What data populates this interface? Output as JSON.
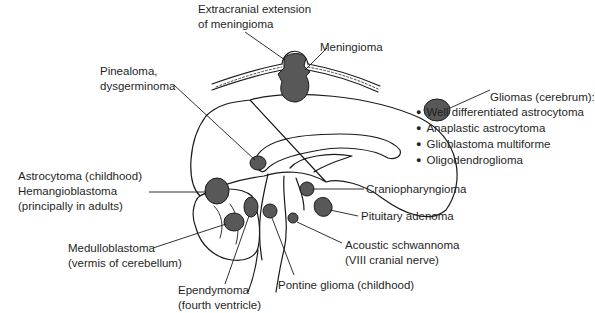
{
  "diagram": {
    "colors": {
      "tumor_fill": "#585858",
      "outline": "#1a1a1a",
      "background": "#ffffff"
    },
    "labels": {
      "extracranial": {
        "line1": "Extracranial extension",
        "line2": "of meningioma"
      },
      "meningioma": "Meningioma",
      "pinealoma": {
        "line1": "Pinealoma,",
        "line2": "dysgerminoma"
      },
      "gliomas": {
        "title": "Gliomas (cerebrum):",
        "items": [
          "Well differentiated astrocytoma",
          "Anaplastic astrocytoma",
          "Glioblastoma multiforme",
          "Oligodendroglioma"
        ]
      },
      "astrocytoma": {
        "line1": "Astrocytoma (childhood)",
        "line2": "Hemangioblastoma",
        "line3": "(principally in adults)"
      },
      "craniopharyngioma": "Craniopharyngioma",
      "pituitary": "Pituitary adenoma",
      "medulloblastoma": {
        "line1": "Medulloblastoma",
        "line2": "(vermis of cerebellum)"
      },
      "acoustic": {
        "line1": "Acoustic schwannoma",
        "line2": "(VIII cranial nerve)"
      },
      "ependymoma": {
        "line1": "Ependymoma",
        "line2": "(fourth ventricle)"
      },
      "pontine": "Pontine glioma (childhood)"
    }
  }
}
